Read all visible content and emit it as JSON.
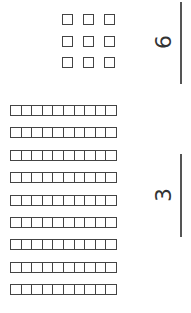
{
  "ones": {
    "count": 9,
    "digit": "6",
    "layout": "3x3 grid of unit squares"
  },
  "tens": {
    "rods": 9,
    "cells_per_rod": 10,
    "digit": "3"
  },
  "orientation": "rotated -90 degrees",
  "colors": {
    "ink": "#444444",
    "background": "#ffffff"
  }
}
